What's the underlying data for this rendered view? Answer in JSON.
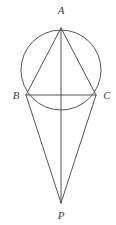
{
  "figure": {
    "background_color": "#ffffff",
    "stroke_color": "#555555",
    "label_color": "#3f3f3f",
    "stroke_width": 1,
    "canvas": {
      "width": 116,
      "height": 225
    }
  },
  "circle": {
    "name": "circumscribed-circle",
    "center_x": 61,
    "center_y": 70,
    "radius": 40,
    "fill": "none"
  },
  "points": [
    {
      "id": "A",
      "label": "A",
      "x": 61,
      "y": 28,
      "label_x": 61,
      "label_y": 14,
      "anchor": "middle"
    },
    {
      "id": "B",
      "label": "B",
      "x": 26,
      "y": 95,
      "label_x": 16,
      "label_y": 99,
      "anchor": "middle"
    },
    {
      "id": "C",
      "label": "C",
      "x": 96,
      "y": 95,
      "label_x": 107,
      "label_y": 99,
      "anchor": "middle"
    },
    {
      "id": "P",
      "label": "P",
      "x": 61,
      "y": 203,
      "label_x": 61,
      "label_y": 219,
      "anchor": "middle"
    }
  ],
  "segments": [
    {
      "id": "AB",
      "name": "segment-a-b",
      "x1": 61,
      "y1": 28,
      "x2": 26,
      "y2": 95
    },
    {
      "id": "AC",
      "name": "segment-a-c",
      "x1": 61,
      "y1": 28,
      "x2": 96,
      "y2": 95
    },
    {
      "id": "BC",
      "name": "segment-b-c",
      "x1": 26,
      "y1": 95,
      "x2": 96,
      "y2": 95
    },
    {
      "id": "AP",
      "name": "segment-a-p",
      "x1": 61,
      "y1": 28,
      "x2": 61,
      "y2": 203
    },
    {
      "id": "BP",
      "name": "segment-b-p",
      "x1": 26,
      "y1": 95,
      "x2": 61,
      "y2": 203
    },
    {
      "id": "CP",
      "name": "segment-c-p",
      "x1": 96,
      "y1": 95,
      "x2": 61,
      "y2": 203
    }
  ]
}
